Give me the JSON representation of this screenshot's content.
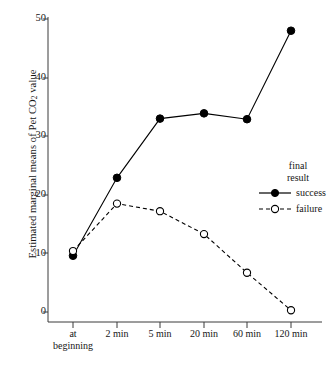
{
  "chart_data": {
    "type": "line",
    "title": "",
    "xlabel": "",
    "ylabel": "Estimated marginal means of Pet CO2 value",
    "ylabel_prefix": "Estimated marginal means of Pet CO",
    "ylabel_sub": "2",
    "ylabel_suffix": " value",
    "categories": [
      "at beginning",
      "2 min",
      "5 min",
      "20 min",
      "60 min",
      "120 min"
    ],
    "category_lines": [
      [
        "at",
        "beginning"
      ],
      [
        "2 min"
      ],
      [
        "5 min"
      ],
      [
        "20 min"
      ],
      [
        "60 min"
      ],
      [
        "120 min"
      ]
    ],
    "series": [
      {
        "name": "success",
        "marker": "filled-circle",
        "line": "solid",
        "color": "#000000",
        "values": [
          9.6,
          22.9,
          33.0,
          33.9,
          32.9,
          48.0
        ]
      },
      {
        "name": "failure",
        "marker": "open-circle",
        "line": "dashed",
        "color": "#000000",
        "values": [
          10.4,
          18.5,
          17.2,
          13.3,
          6.7,
          0.3
        ]
      }
    ],
    "ylim": [
      0,
      50
    ],
    "yticks": [
      0,
      10,
      20,
      30,
      40,
      50
    ],
    "ytick_labels": [
      "0",
      "10",
      "20",
      "30",
      "40",
      "50"
    ],
    "grid": false,
    "legend_position": "right-middle",
    "legend": {
      "title_lines": [
        "final",
        "result"
      ],
      "entries": [
        "success",
        "failure"
      ]
    }
  }
}
